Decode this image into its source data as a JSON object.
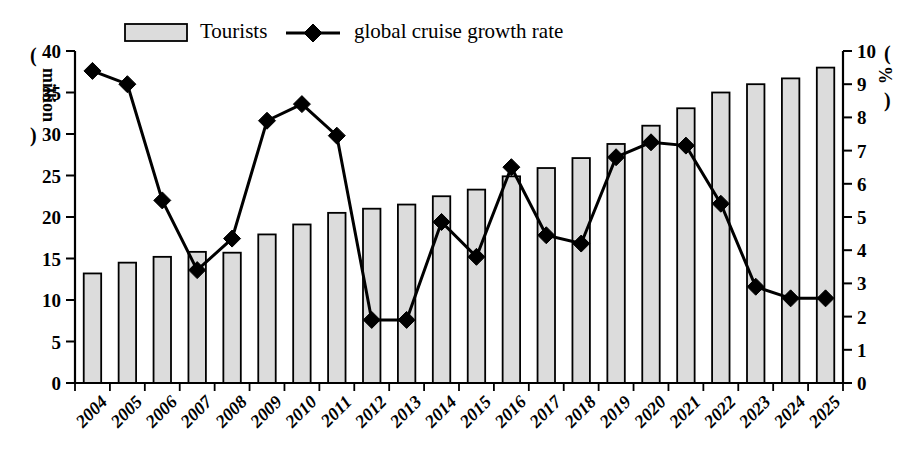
{
  "chart_data": {
    "type": "bar",
    "title": "",
    "subtitle": "",
    "xlabel": "",
    "ylabel": "(million)",
    "y2label": "(%)",
    "grid": false,
    "legend_position": "top-center",
    "categories": [
      "2004",
      "2005",
      "2006",
      "2007",
      "2008",
      "2009",
      "2010",
      "2011",
      "2012",
      "2013",
      "2014",
      "2015",
      "2016",
      "2017",
      "2018",
      "2019",
      "2020",
      "2021",
      "2022",
      "2023",
      "2024",
      "2025"
    ],
    "ylim": [
      0,
      40
    ],
    "yticks": [
      0,
      5,
      10,
      15,
      20,
      25,
      30,
      35,
      40
    ],
    "y2lim": [
      0,
      10
    ],
    "y2ticks": [
      0,
      1,
      2,
      3,
      4,
      5,
      6,
      7,
      8,
      9,
      10
    ],
    "series": [
      {
        "name": "Tourists",
        "type": "bar",
        "axis": "left",
        "unit": "million",
        "color": "#dcdcdc",
        "edge_color": "#000000",
        "values": [
          13.2,
          14.5,
          15.2,
          15.8,
          15.7,
          17.9,
          19.1,
          20.5,
          21.0,
          21.5,
          22.5,
          23.3,
          24.9,
          25.9,
          27.1,
          28.8,
          31.0,
          33.1,
          35.0,
          36.0,
          36.7,
          38.0
        ]
      },
      {
        "name": "global cruise growth rate",
        "type": "line",
        "axis": "right",
        "unit": "%",
        "color": "#000000",
        "marker": "diamond",
        "values": [
          9.4,
          9.0,
          5.5,
          3.4,
          4.35,
          7.9,
          8.4,
          7.45,
          1.9,
          1.9,
          4.85,
          3.8,
          6.5,
          4.45,
          4.2,
          6.8,
          7.25,
          7.15,
          5.4,
          2.9,
          2.55,
          2.55
        ]
      }
    ]
  },
  "legend": {
    "items": [
      {
        "label": "Tourists",
        "marker": "bar-swatch"
      },
      {
        "label": "global cruise growth rate",
        "marker": "line-diamond"
      }
    ]
  },
  "axes": {
    "left_title": "million",
    "right_title": "%",
    "left_paren_open": "(",
    "left_paren_close": ")",
    "right_paren_open": "(",
    "right_paren_close": ")"
  }
}
